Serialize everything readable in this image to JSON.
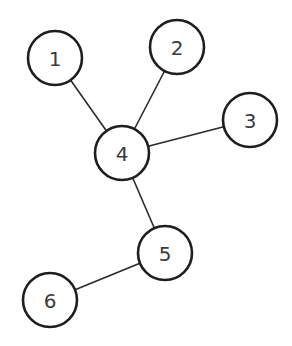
{
  "diagram": {
    "type": "tree-graph",
    "nodes": [
      {
        "id": "1",
        "label": "1",
        "cx": 55,
        "cy": 58,
        "r": 27
      },
      {
        "id": "2",
        "label": "2",
        "cx": 177,
        "cy": 47,
        "r": 27
      },
      {
        "id": "3",
        "label": "3",
        "cx": 250,
        "cy": 120,
        "r": 27
      },
      {
        "id": "4",
        "label": "4",
        "cx": 122,
        "cy": 153,
        "r": 27
      },
      {
        "id": "5",
        "label": "5",
        "cx": 165,
        "cy": 253,
        "r": 27
      },
      {
        "id": "6",
        "label": "6",
        "cx": 50,
        "cy": 300,
        "r": 27
      }
    ],
    "edges": [
      {
        "from": "1",
        "to": "4"
      },
      {
        "from": "2",
        "to": "4"
      },
      {
        "from": "3",
        "to": "4"
      },
      {
        "from": "4",
        "to": "5"
      },
      {
        "from": "5",
        "to": "6"
      }
    ],
    "colors": {
      "stroke": "#1e1e1e",
      "edge": "#2a2a2a",
      "label": "#3a3a3a",
      "background": "#ffffff"
    }
  }
}
